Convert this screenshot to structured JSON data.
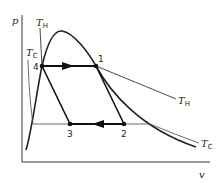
{
  "diagram": {
    "type": "p-v diagram with isotherms and vapor dome (refrigeration cycle)",
    "axes": {
      "y_label": "p",
      "x_label": "v"
    },
    "isotherms": [
      {
        "name": "T",
        "subscript": "H"
      },
      {
        "name": "T",
        "subscript": "C"
      }
    ],
    "isotherm_labels": {
      "th_left": {
        "main": "T",
        "sub": "H"
      },
      "tc_left": {
        "main": "T",
        "sub": "C"
      },
      "th_right": {
        "main": "T",
        "sub": "H"
      },
      "tc_right": {
        "main": "T",
        "sub": "C"
      }
    },
    "points": [
      {
        "id": "1",
        "label": "1"
      },
      {
        "id": "2",
        "label": "2"
      },
      {
        "id": "3",
        "label": "3"
      },
      {
        "id": "4",
        "label": "4"
      }
    ],
    "processes": [
      {
        "from": "4",
        "to": "1",
        "direction": "right",
        "isotherm": "T_H"
      },
      {
        "from": "1",
        "to": "2",
        "type": "line"
      },
      {
        "from": "2",
        "to": "3",
        "direction": "left",
        "isotherm": "T_C"
      },
      {
        "from": "3",
        "to": "4",
        "type": "line"
      }
    ],
    "colors": {
      "line": "#222222",
      "background": "#ffffff"
    }
  }
}
